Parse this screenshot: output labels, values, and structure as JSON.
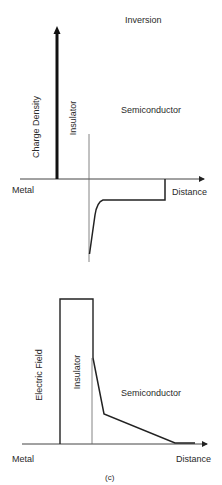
{
  "figure": {
    "caption": "(c)",
    "top_panel": {
      "title": "Inversion",
      "y_label": "Charge Density",
      "region_insulator": "Insulator",
      "region_semiconductor": "Semiconductor",
      "left_label": "Metal",
      "x_label": "Distance"
    },
    "bottom_panel": {
      "y_label": "Electric Field",
      "region_insulator": "Insulator",
      "region_semiconductor": "Semiconductor",
      "left_label": "Metal",
      "x_label": "Distance"
    }
  },
  "colors": {
    "line": "#222222",
    "thin_line": "#555555",
    "background": "#ffffff"
  }
}
